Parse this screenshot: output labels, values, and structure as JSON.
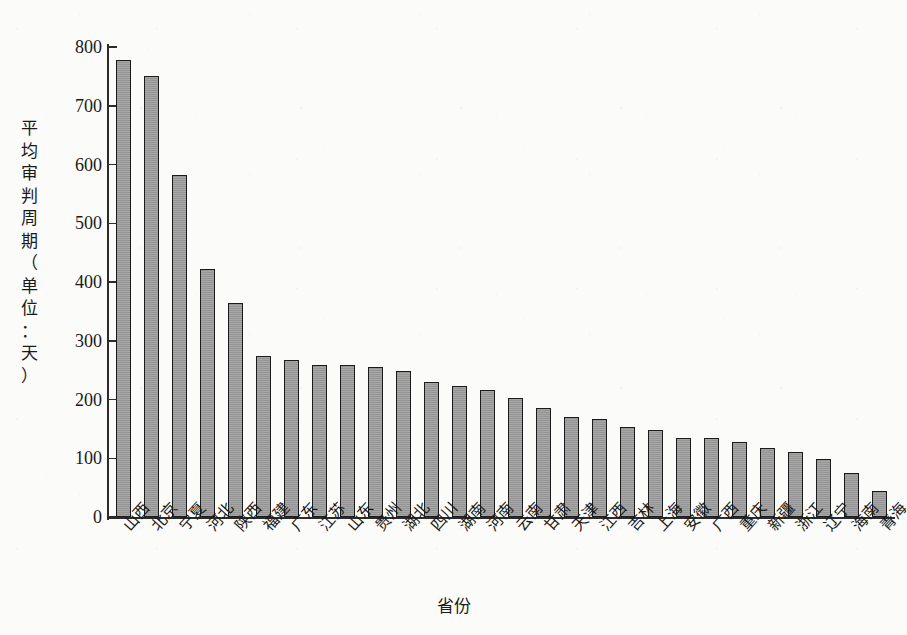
{
  "chart_data": {
    "type": "bar",
    "title": "",
    "xlabel": "省份",
    "ylabel": "平均审判周期（单位：天）",
    "ylabel_chars": "平\n均\n审\n判\n周\n期\n（\n单\n位\n：\n天\n）",
    "ylim": [
      0,
      800
    ],
    "ytick_step": 100,
    "yticks": [
      "800",
      "700",
      "600",
      "500",
      "400",
      "300",
      "200",
      "100",
      "0"
    ],
    "ytick_values": [
      800,
      700,
      600,
      500,
      400,
      300,
      200,
      100,
      0
    ],
    "grid": false,
    "legend": "none",
    "bar_color": "#9c9c9c",
    "bar_edge_color": "#1b1b1b",
    "axis_color": "#2b2b2b",
    "background_color": "#fbfbf9",
    "categories": [
      "山西",
      "北京",
      "宁夏",
      "河北",
      "陕西",
      "福建",
      "广东",
      "江苏",
      "山东",
      "贵州",
      "湖北",
      "四川",
      "湖南",
      "河南",
      "云南",
      "甘肃",
      "天津",
      "江西",
      "吉林",
      "上海",
      "安徽",
      "广西",
      "重庆",
      "新疆",
      "浙江",
      "辽宁",
      "海南",
      "青海"
    ],
    "values": [
      778,
      750,
      582,
      422,
      365,
      274,
      267,
      259,
      259,
      255,
      249,
      230,
      223,
      216,
      203,
      186,
      171,
      167,
      153,
      148,
      135,
      135,
      128,
      117,
      110,
      99,
      75,
      44
    ],
    "series": [
      {
        "name": "平均审判周期",
        "unit": "天",
        "values": [
          778,
          750,
          582,
          422,
          365,
          274,
          267,
          259,
          259,
          255,
          249,
          230,
          223,
          216,
          203,
          186,
          171,
          167,
          153,
          148,
          135,
          135,
          128,
          117,
          110,
          99,
          75,
          44
        ]
      }
    ]
  }
}
